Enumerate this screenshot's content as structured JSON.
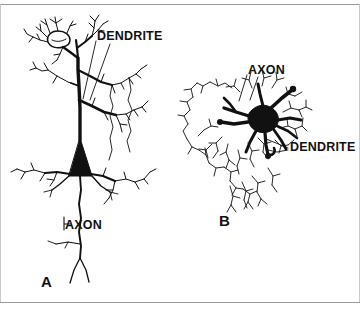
{
  "figure": {
    "background_color": "#ffffff",
    "ink_color": "#111111",
    "rule_color": "#9a9a9a",
    "panels": [
      {
        "id": "A",
        "panel_label": "A",
        "cell_type": "pyramidal neuron",
        "labels": [
          {
            "name": "dendrite",
            "text": "DENDRITE"
          },
          {
            "name": "axon",
            "text": "AXON"
          }
        ]
      },
      {
        "id": "B",
        "panel_label": "B",
        "cell_type": "stellate neuron",
        "labels": [
          {
            "name": "axon",
            "text": "AXON"
          },
          {
            "name": "dendrite",
            "text": "DENDRITE"
          }
        ]
      }
    ]
  }
}
